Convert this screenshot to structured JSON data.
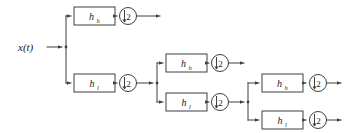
{
  "diagram": {
    "input_label": "x(t)",
    "highpass_label": "h",
    "highpass_sub": "h",
    "lowpass_label": "h",
    "lowpass_sub": "l",
    "downsample_label": "2",
    "downsample_arrow": "↓",
    "colors": {
      "background": "#ffffff",
      "stroke": "#3f3f3f",
      "text": "#1a1a1a",
      "box_fill": "#ffffff"
    },
    "stages": [
      {
        "name": "stage-1",
        "branches": [
          {
            "id": "s1-high",
            "filter": "h",
            "sub": "h",
            "down": "2",
            "terminal": true
          },
          {
            "id": "s1-low",
            "filter": "h",
            "sub": "l",
            "down": "2",
            "terminal": false
          }
        ]
      },
      {
        "name": "stage-2",
        "branches": [
          {
            "id": "s2-high",
            "filter": "h",
            "sub": "h",
            "down": "2",
            "terminal": true
          },
          {
            "id": "s2-low",
            "filter": "h",
            "sub": "l",
            "down": "2",
            "terminal": false
          }
        ]
      },
      {
        "name": "stage-3",
        "branches": [
          {
            "id": "s3-high",
            "filter": "h",
            "sub": "h",
            "down": "2",
            "terminal": true
          },
          {
            "id": "s3-low",
            "filter": "h",
            "sub": "l",
            "down": "2",
            "terminal": true
          }
        ]
      }
    ]
  }
}
